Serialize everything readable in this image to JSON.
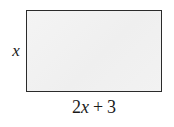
{
  "figure": {
    "type": "rectangle-diagram",
    "shape": {
      "name": "rectangle",
      "fill_color": "#f0f0f0",
      "stroke_color": "#2b2b2b"
    },
    "labels": {
      "height": {
        "text": "x",
        "position": "left"
      },
      "width": {
        "full_text": "2x + 3",
        "coefficient": "2",
        "variable": "x",
        "operator": "+",
        "constant": "3",
        "position": "bottom"
      }
    },
    "background_color": "#ffffff"
  }
}
